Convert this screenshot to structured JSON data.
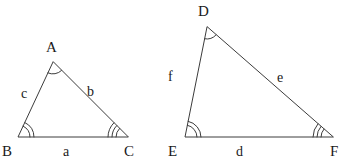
{
  "figure": {
    "background_color": "#ffffff",
    "stroke_color": "#3c3c3c",
    "text_color": "#1a1a1a"
  },
  "triangles": [
    {
      "name": "triangle-abc",
      "vertices": [
        {
          "id": "A",
          "label": "A",
          "x": 53,
          "y": 62,
          "label_x": 46,
          "label_y": 40,
          "arc_count": 1
        },
        {
          "id": "B",
          "label": "B",
          "x": 18,
          "y": 137,
          "label_x": 2,
          "label_y": 144,
          "arc_count": 2
        },
        {
          "id": "C",
          "label": "C",
          "x": 128,
          "y": 137,
          "label_x": 124,
          "label_y": 144,
          "arc_count": 3
        }
      ],
      "sides": [
        {
          "id": "a",
          "label": "a",
          "between": "B-C",
          "label_x": 63,
          "label_y": 145
        },
        {
          "id": "b",
          "label": "b",
          "between": "A-C",
          "label_x": 87,
          "label_y": 85
        },
        {
          "id": "c",
          "label": "c",
          "between": "A-B",
          "label_x": 21,
          "label_y": 87
        }
      ]
    },
    {
      "name": "triangle-def",
      "vertices": [
        {
          "id": "D",
          "label": "D",
          "x": 207,
          "y": 27,
          "label_x": 198,
          "label_y": 4,
          "arc_count": 1
        },
        {
          "id": "E",
          "label": "E",
          "x": 185,
          "y": 137,
          "label_x": 168,
          "label_y": 144,
          "arc_count": 2
        },
        {
          "id": "F",
          "label": "F",
          "x": 333,
          "y": 137,
          "label_x": 330,
          "label_y": 144,
          "arc_count": 3
        }
      ],
      "sides": [
        {
          "id": "d",
          "label": "d",
          "between": "E-F",
          "label_x": 236,
          "label_y": 145
        },
        {
          "id": "e",
          "label": "e",
          "between": "D-F",
          "label_x": 277,
          "label_y": 71
        },
        {
          "id": "f",
          "label": "f",
          "between": "D-E",
          "label_x": 168,
          "label_y": 70
        }
      ]
    }
  ]
}
